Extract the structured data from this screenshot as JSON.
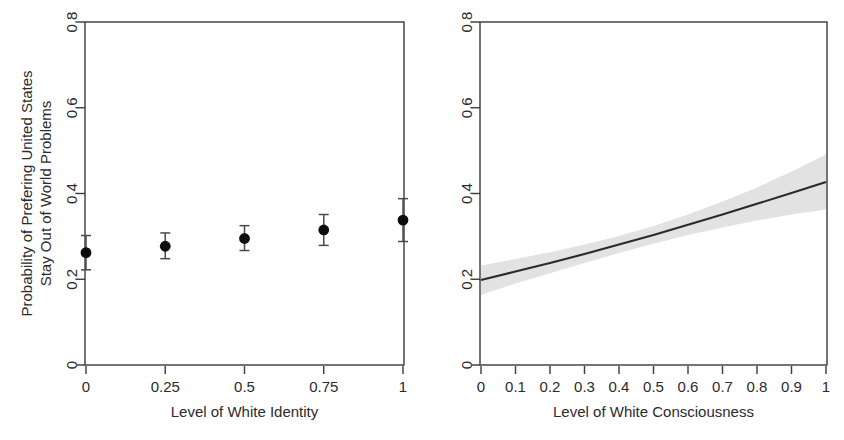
{
  "figure": {
    "background_color": "#ffffff",
    "point_color": "#0d0d0d",
    "line_color": "#2a2a2a",
    "band_color": "#e2e2e2",
    "axis_color": "#3a3a3a"
  },
  "chart_data": [
    {
      "type": "scatter",
      "panel": "left",
      "title": "",
      "xlabel": "Level of White Identity",
      "ylabel": "Probability of Prefering United States\nStay Out of World Problems",
      "ylabel_line1": "Probability of Prefering United States",
      "ylabel_line2": "Stay Out of World Problems",
      "xlim": [
        0,
        1
      ],
      "ylim": [
        0,
        0.8
      ],
      "xticks": [
        0,
        0.25,
        0.5,
        0.75,
        1
      ],
      "xticklabels": [
        "0",
        "0.25",
        "0.5",
        "0.75",
        "1"
      ],
      "yticks": [
        0,
        0.2,
        0.4,
        0.6,
        0.8
      ],
      "yticklabels": [
        "0",
        "0.2",
        "0.4",
        "0.6",
        "0.8"
      ],
      "grid": false,
      "legend": "none",
      "x": [
        0,
        0.25,
        0.5,
        0.75,
        1
      ],
      "values": [
        0.262,
        0.277,
        0.295,
        0.315,
        0.338
      ],
      "ci_lower": [
        0.222,
        0.248,
        0.267,
        0.279,
        0.288
      ],
      "ci_upper": [
        0.302,
        0.308,
        0.325,
        0.351,
        0.388
      ],
      "marker": "filled-circle",
      "errorbar": "capped-vertical"
    },
    {
      "type": "line",
      "panel": "right",
      "title": "",
      "xlabel": "Level of White Consciousness",
      "ylabel": "",
      "xlim": [
        0,
        1
      ],
      "ylim": [
        0,
        0.8
      ],
      "xticks": [
        0,
        0.1,
        0.2,
        0.3,
        0.4,
        0.5,
        0.6,
        0.7,
        0.8,
        0.9,
        1
      ],
      "xticklabels": [
        "0",
        "0.1",
        "0.2",
        "0.3",
        "0.4",
        "0.5",
        "0.6",
        "0.7",
        "0.8",
        "0.9",
        "1"
      ],
      "yticks": [
        0,
        0.2,
        0.4,
        0.6,
        0.8
      ],
      "yticklabels": [
        "0",
        "0.2",
        "0.4",
        "0.6",
        "0.8"
      ],
      "grid": false,
      "legend": "none",
      "x": [
        0,
        0.1,
        0.2,
        0.3,
        0.4,
        0.5,
        0.6,
        0.7,
        0.8,
        0.9,
        1
      ],
      "values": [
        0.198,
        0.218,
        0.238,
        0.259,
        0.281,
        0.303,
        0.327,
        0.351,
        0.376,
        0.401,
        0.427
      ],
      "ci_lower": [
        0.163,
        0.19,
        0.214,
        0.238,
        0.261,
        0.283,
        0.303,
        0.321,
        0.337,
        0.351,
        0.363
      ],
      "ci_upper": [
        0.232,
        0.247,
        0.263,
        0.281,
        0.301,
        0.324,
        0.351,
        0.381,
        0.414,
        0.451,
        0.491
      ],
      "band_label": "confidence interval"
    }
  ]
}
